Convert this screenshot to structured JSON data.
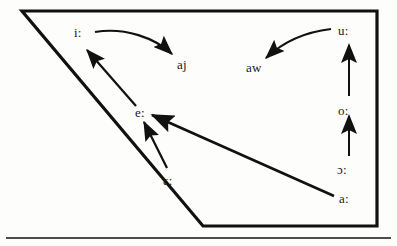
{
  "figure": {
    "type": "vowel-shift-diagram",
    "background_color": "#fdfdfc",
    "stroke_color": "#111111",
    "text_color": "#1a1a1a",
    "quadrilateral": {
      "points": "22,11 377,11 377,226 203,226",
      "stroke_width": 3.2
    },
    "bottom_rule": {
      "y": 238,
      "x1": 6,
      "x2": 391,
      "stroke_width": 1.6
    },
    "labels": [
      {
        "id": "i",
        "text": "i:",
        "x": 74,
        "y": 26
      },
      {
        "id": "aj",
        "text": "aj",
        "x": 177,
        "y": 58
      },
      {
        "id": "aw",
        "text": "aw",
        "x": 246,
        "y": 61
      },
      {
        "id": "u",
        "text": "u:",
        "x": 338,
        "y": 24
      },
      {
        "id": "e",
        "text": "e:",
        "x": 135,
        "y": 106
      },
      {
        "id": "o",
        "text": "o:",
        "x": 338,
        "y": 104
      },
      {
        "id": "epsilon",
        "text": "ɛ:",
        "x": 163,
        "y": 174
      },
      {
        "id": "openo",
        "text": "ɔ:",
        "x": 337,
        "y": 163
      },
      {
        "id": "a",
        "text": "a:",
        "x": 339,
        "y": 192
      }
    ],
    "arrows": [
      {
        "id": "i-to-aj",
        "from": "i:",
        "to": "aj",
        "shape": "curved"
      },
      {
        "id": "u-to-aw",
        "from": "u:",
        "to": "aw",
        "shape": "curved"
      },
      {
        "id": "e-to-i",
        "from": "e:",
        "to": "i:",
        "shape": "straight"
      },
      {
        "id": "eps-to-e",
        "from": "ɛ:",
        "to": "e:",
        "shape": "straight"
      },
      {
        "id": "a-to-e",
        "from": "a:",
        "to": "e:",
        "shape": "straight"
      },
      {
        "id": "o-to-u",
        "from": "o:",
        "to": "u:",
        "shape": "straight-vertical"
      },
      {
        "id": "openo-to-o",
        "from": "ɔ:",
        "to": "o:",
        "shape": "straight-vertical"
      }
    ]
  }
}
